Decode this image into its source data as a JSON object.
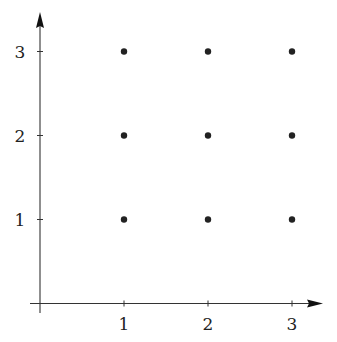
{
  "chart_data": {
    "type": "scatter",
    "title": "",
    "xlabel": "",
    "ylabel": "",
    "xlim": [
      0,
      3.35
    ],
    "ylim": [
      0,
      3.45
    ],
    "grid": false,
    "legend": null,
    "x_ticks": [
      1,
      2,
      3
    ],
    "y_ticks": [
      1,
      2,
      3
    ],
    "x_tick_labels": [
      "1",
      "2",
      "3"
    ],
    "y_tick_labels": [
      "1",
      "2",
      "3"
    ],
    "series": [
      {
        "name": "lattice points",
        "points": [
          {
            "x": 1,
            "y": 1
          },
          {
            "x": 2,
            "y": 1
          },
          {
            "x": 3,
            "y": 1
          },
          {
            "x": 1,
            "y": 2
          },
          {
            "x": 2,
            "y": 2
          },
          {
            "x": 3,
            "y": 2
          },
          {
            "x": 1,
            "y": 3
          },
          {
            "x": 2,
            "y": 3
          },
          {
            "x": 3,
            "y": 3
          }
        ]
      }
    ]
  },
  "style": {
    "axis_color": "#333333",
    "point_color": "#222222"
  }
}
